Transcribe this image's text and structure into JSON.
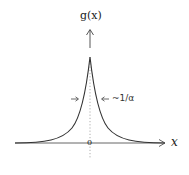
{
  "diagram": {
    "type": "laplace-peak",
    "y_axis_label": "g(x)",
    "x_axis_label": "x",
    "origin_label": "0",
    "width_annotation": "~1/α",
    "colors": {
      "curve": "#333333",
      "axis": "#555555",
      "dashed": "#888888",
      "text": "#222222"
    }
  }
}
